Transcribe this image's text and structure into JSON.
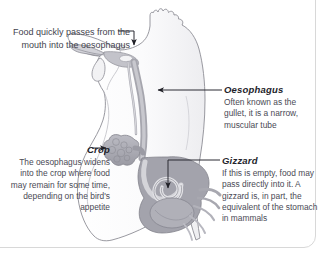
{
  "figure": {
    "colors": {
      "body_outline": "#8b8b93",
      "body_fill": "#fdfdfd",
      "organ_light": "#c9c9cf",
      "organ_mid": "#a8a8b0",
      "organ_dark": "#8e8e98",
      "leader_line": "#2b2b32",
      "text": "#4a4a55",
      "heading": "#23232a",
      "page_border": "#d8d8d8"
    },
    "parts": [
      "comb",
      "beak",
      "wattle",
      "oesophagus",
      "crop",
      "proventriculus",
      "gizzard",
      "intestine"
    ]
  },
  "callouts": {
    "mouth": {
      "text": "Food quickly passes from the mouth into the oesophagus",
      "arrow": "down-arrow-icon"
    },
    "oesophagus": {
      "heading": "Oesophagus",
      "text": "Often known as the gullet, it is a narrow, muscular tube",
      "arrow": "left-arrow-icon"
    },
    "crop": {
      "heading": "Crop",
      "text": "The oesophagus widens into the crop where food may remain for some time, depending on the bird's appetite",
      "arrow": "right-arrow-icon"
    },
    "gizzard": {
      "heading": "Gizzard",
      "text": "If this is empty, food may pass directly into it. A gizzard is, in part, the equivalent of the stomach in mammals",
      "arrow": "down-arrow-icon"
    }
  }
}
